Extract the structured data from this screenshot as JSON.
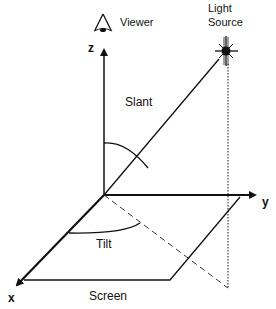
{
  "diagram": {
    "type": "3d-coordinate-illustration",
    "labels": {
      "viewer": "Viewer",
      "light_source_line1": "Light",
      "light_source_line2": "Source",
      "slant": "Slant",
      "tilt": "Tilt",
      "screen": "Screen",
      "axis_x": "x",
      "axis_y": "y",
      "axis_z": "z"
    },
    "icons": {
      "viewer": "eye-icon",
      "light_source": "sun-burst-icon"
    },
    "colors": {
      "stroke": "#111111",
      "background": "#ffffff"
    }
  }
}
